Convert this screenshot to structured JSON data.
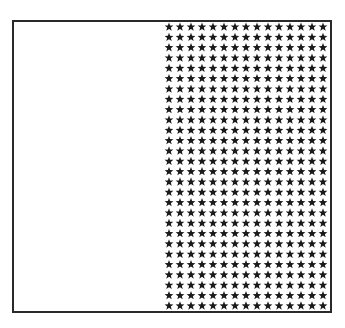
{
  "diagram": {
    "type": "grid-of-stars",
    "frame": {
      "border_color": "#2a2a2a",
      "background": "#ffffff"
    },
    "star_grid": {
      "columns": 15,
      "rows": 28,
      "total": 420,
      "symbol": "★",
      "symbol_name": "star-icon",
      "color": "#1a1a1a",
      "position": "right-half"
    },
    "empty_region": {
      "position": "left-half"
    }
  }
}
